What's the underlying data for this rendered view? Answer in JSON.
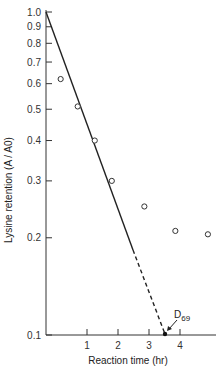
{
  "chart_data": {
    "type": "scatter",
    "title": "",
    "xlabel": "Reaction time (hr)",
    "ylabel": "Lysine retention (A / A0)",
    "yscale": "log",
    "ylim": [
      0.1,
      1.0
    ],
    "xticks": [
      1,
      2,
      3,
      4
    ],
    "yticks": [
      {
        "value": 1.0,
        "label": "1.0"
      },
      {
        "value": 0.9,
        "label": "0.9"
      },
      {
        "value": 0.8,
        "label": "0.8"
      },
      {
        "value": 0.7,
        "label": "0.7"
      },
      {
        "value": 0.6,
        "label": "0.6"
      },
      {
        "value": 0.5,
        "label": "0.5"
      },
      {
        "value": 0.4,
        "label": "0.4"
      },
      {
        "value": 0.3,
        "label": "0.3"
      },
      {
        "value": 0.2,
        "label": "0.2"
      },
      {
        "value": 0.1,
        "label": "0.1"
      }
    ],
    "series": [
      {
        "name": "Measured lysine retention",
        "marker": "open-circle",
        "x": [
          0.15,
          0.7,
          1.25,
          1.8,
          2.85,
          3.85,
          4.9
        ],
        "y": [
          0.62,
          0.51,
          0.4,
          0.3,
          0.25,
          0.21,
          0.205
        ]
      }
    ],
    "fit_line": {
      "solid": {
        "x": [
          -0.33,
          2.5
        ],
        "y": [
          1.0,
          0.185
        ]
      },
      "dashed": {
        "x": [
          2.5,
          3.5
        ],
        "y": [
          0.185,
          0.1
        ]
      }
    },
    "annotations": [
      {
        "text": "D",
        "subscript": "69",
        "x": 3.5,
        "y": 0.1,
        "note": "arrow points to dashed line intercept at 0.1"
      }
    ],
    "grid": false,
    "legend": null
  }
}
